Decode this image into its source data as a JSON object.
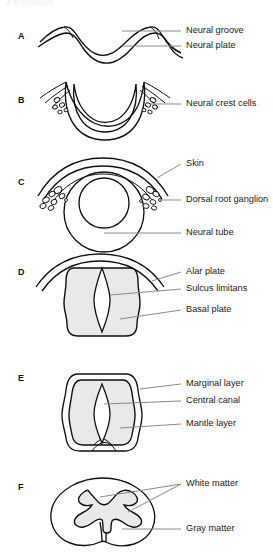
{
  "figure": {
    "cut_off_title": "A  F  STAGES",
    "background_color": "#ffffff",
    "line_color": "#111111",
    "leader_color": "#8a8a8a",
    "gray_fill_color": "#e9e9e9",
    "panels": [
      {
        "letter": "A",
        "description": "Neural plate folding into neural groove",
        "labels": [
          {
            "text": "Neural groove"
          },
          {
            "text": "Neural plate"
          }
        ]
      },
      {
        "letter": "B",
        "description": "Crescent-shaped neural groove with neural crest cells at the tips",
        "labels": [
          {
            "text": "Neural crest cells"
          }
        ]
      },
      {
        "letter": "C",
        "description": "Closed neural tube with overlying skin and dorsal root ganglia",
        "labels": [
          {
            "text": "Skin"
          },
          {
            "text": "Dorsal root ganglion"
          },
          {
            "text": "Neural tube"
          }
        ]
      },
      {
        "letter": "D",
        "description": "Neural tube showing alar plate, sulcus limitans and basal plate",
        "labels": [
          {
            "text": "Alar plate"
          },
          {
            "text": "Sulcus limitans"
          },
          {
            "text": "Basal plate"
          }
        ]
      },
      {
        "letter": "E",
        "description": "Developing cord with marginal layer, central canal and mantle layer",
        "labels": [
          {
            "text": "Marginal layer"
          },
          {
            "text": "Central canal"
          },
          {
            "text": "Mantle layer"
          }
        ]
      },
      {
        "letter": "F",
        "description": "Mature spinal cord cross-section with butterfly gray matter",
        "labels": [
          {
            "text": "White matter"
          },
          {
            "text": "Gray matter"
          }
        ]
      }
    ]
  }
}
